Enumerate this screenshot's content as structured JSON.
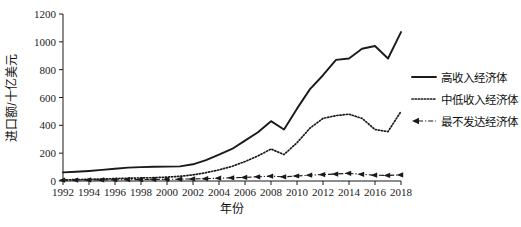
{
  "chart_data": {
    "type": "line",
    "title": "",
    "xlabel": "年份",
    "ylabel": "进口额/十亿美元",
    "xlim": [
      1992,
      2018
    ],
    "ylim": [
      0,
      1200
    ],
    "grid": false,
    "legend_position": "right",
    "x": [
      1992,
      1993,
      1994,
      1995,
      1996,
      1997,
      1998,
      1999,
      2000,
      2001,
      2002,
      2003,
      2004,
      2005,
      2006,
      2007,
      2008,
      2009,
      2010,
      2011,
      2012,
      2013,
      2014,
      2015,
      2016,
      2017,
      2018
    ],
    "xtick_labels": [
      "1992",
      "1994",
      "1996",
      "1998",
      "2000",
      "2002",
      "2004",
      "2006",
      "2008",
      "2010",
      "2012",
      "2014",
      "2016",
      "2018"
    ],
    "ytick_labels": [
      "0",
      "200",
      "400",
      "600",
      "800",
      "1000",
      "1200"
    ],
    "ytick_values": [
      0,
      200,
      400,
      600,
      800,
      1000,
      1200
    ],
    "series": [
      {
        "name": "高收入经济体",
        "style": "solid",
        "color": "#1a1a1a",
        "values": [
          62,
          66,
          72,
          80,
          88,
          96,
          100,
          102,
          103,
          105,
          120,
          150,
          190,
          230,
          290,
          350,
          430,
          370,
          520,
          660,
          760,
          870,
          880,
          950,
          970,
          880,
          1070
        ]
      },
      {
        "name": "中低收入经济体",
        "style": "dotted",
        "color": "#1a1a1a",
        "values": [
          8,
          10,
          12,
          14,
          17,
          20,
          22,
          24,
          28,
          34,
          44,
          60,
          80,
          105,
          140,
          180,
          230,
          190,
          275,
          380,
          450,
          470,
          480,
          450,
          370,
          355,
          500
        ]
      },
      {
        "name": "最不发达经济体",
        "style": "dashdot-arrow",
        "color": "#1a1a1a",
        "values": [
          6,
          7,
          8,
          8,
          9,
          10,
          10,
          11,
          12,
          13,
          15,
          17,
          20,
          23,
          26,
          30,
          35,
          30,
          36,
          42,
          46,
          50,
          55,
          48,
          42,
          40,
          44
        ]
      }
    ]
  },
  "legend": {
    "items": [
      {
        "label": "高收入经济体",
        "style": "solid"
      },
      {
        "label": "中低收入经济体",
        "style": "dotted"
      },
      {
        "label": "最不发达经济体",
        "style": "dashdot-arrow"
      }
    ]
  }
}
